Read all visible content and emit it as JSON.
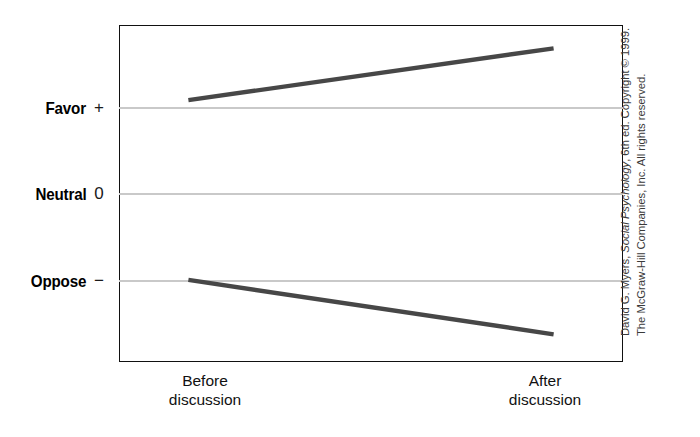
{
  "chart_data": {
    "type": "line",
    "title": "",
    "xlabel": "",
    "ylabel": "",
    "categories": [
      "Before discussion",
      "After discussion"
    ],
    "x": [
      0,
      1
    ],
    "ytick_values": [
      1,
      0,
      -1
    ],
    "ytick_symbols": [
      "+",
      "0",
      "−"
    ],
    "ytick_names": [
      "Favor",
      "Neutral",
      "Oppose"
    ],
    "ylim": [
      -1.95,
      1.95
    ],
    "xlim": [
      -0.19,
      1.19
    ],
    "grid": true,
    "legend": "none",
    "series": [
      {
        "name": "Initially favoring group",
        "values": [
          1.08,
          1.68
        ],
        "color": "#474747"
      },
      {
        "name": "Initially opposing group",
        "values": [
          -1.0,
          -1.63
        ],
        "color": "#474747"
      }
    ],
    "annotations": []
  },
  "axis": {
    "y_labels": [
      {
        "name": "Favor",
        "symbol": "+"
      },
      {
        "name": "Neutral",
        "symbol": "0"
      },
      {
        "name": "Oppose",
        "symbol": "−"
      }
    ],
    "x_labels": [
      {
        "line1": "Before",
        "line2": "discussion"
      },
      {
        "line1": "After",
        "line2": "discussion"
      }
    ]
  },
  "credit": {
    "prefix": "David G. Myers, ",
    "book": "Social Psychology",
    "suffix": ", 6th ed. Copyright © 1999. The McGraw-Hill Companies, Inc. All rights reserved."
  },
  "colors": {
    "line": "#474747",
    "gridline": "#c9c9c9",
    "frame": "#111111",
    "background": "#ffffff"
  }
}
